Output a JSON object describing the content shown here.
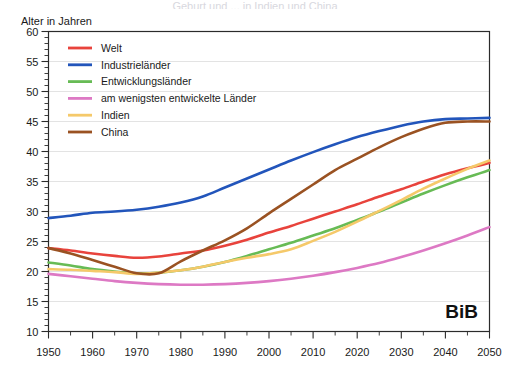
{
  "title": "Geburt und ... in Indien und China",
  "axis": {
    "ylabel": "Alter in Jahren",
    "xlabel": "",
    "y_ticks": [
      "10",
      "15",
      "20",
      "25",
      "30",
      "35",
      "40",
      "45",
      "50",
      "55",
      "60"
    ],
    "x_ticks": [
      "1950",
      "1960",
      "1970",
      "1980",
      "1990",
      "2000",
      "2010",
      "2020",
      "2030",
      "2040",
      "2050"
    ]
  },
  "watermark": "BiB",
  "legend": {
    "position": "top-left-inside",
    "entries": [
      {
        "label": "Welt",
        "color": "#e8433c"
      },
      {
        "label": "Industrieländer",
        "color": "#2255bb"
      },
      {
        "label": "Entwicklungsländer",
        "color": "#67bb55"
      },
      {
        "label": "am wenigsten entwickelte Länder",
        "color": "#dd79c4"
      },
      {
        "label": "Indien",
        "color": "#f5c96a"
      },
      {
        "label": "China",
        "color": "#9a5222"
      }
    ]
  },
  "colors": {
    "welt": "#e8433c",
    "industrielaender": "#2255bb",
    "entwicklungslaender": "#67bb55",
    "ldc": "#dd79c4",
    "indien": "#f5c96a",
    "china": "#9a5222",
    "grid": "#e3e3e3",
    "frame": "#2b2b2b"
  },
  "chart_data": {
    "type": "line",
    "title": "Geburt und ... in Indien und China",
    "xlabel": "",
    "ylabel": "Alter in Jahren",
    "xlim": [
      1950,
      2050
    ],
    "ylim": [
      10,
      60
    ],
    "grid": true,
    "legend_position": "top-left-inside",
    "x": [
      1950,
      1955,
      1960,
      1965,
      1970,
      1975,
      1980,
      1985,
      1990,
      1995,
      2000,
      2005,
      2010,
      2015,
      2020,
      2025,
      2030,
      2035,
      2040,
      2045,
      2050
    ],
    "series": [
      {
        "name": "Welt",
        "color": "#e8433c",
        "values": [
          23.9,
          23.5,
          23.0,
          22.6,
          22.3,
          22.5,
          23.0,
          23.5,
          24.3,
          25.3,
          26.5,
          27.6,
          28.8,
          30.0,
          31.2,
          32.5,
          33.7,
          35.0,
          36.2,
          37.2,
          38.1
        ]
      },
      {
        "name": "Industrieländer",
        "color": "#2255bb",
        "values": [
          28.9,
          29.3,
          29.8,
          30.0,
          30.3,
          30.8,
          31.5,
          32.5,
          34.0,
          35.5,
          37.0,
          38.5,
          39.9,
          41.2,
          42.4,
          43.4,
          44.3,
          45.0,
          45.4,
          45.5,
          45.6
        ]
      },
      {
        "name": "Entwicklungsländer",
        "color": "#67bb55",
        "values": [
          21.5,
          21.0,
          20.4,
          20.0,
          19.7,
          19.8,
          20.2,
          20.8,
          21.6,
          22.6,
          23.7,
          24.8,
          26.0,
          27.2,
          28.6,
          30.0,
          31.5,
          33.0,
          34.4,
          35.7,
          36.9
        ]
      },
      {
        "name": "am wenigsten entwickelte Länder",
        "color": "#dd79c4",
        "values": [
          19.6,
          19.2,
          18.8,
          18.4,
          18.1,
          17.9,
          17.8,
          17.8,
          17.9,
          18.1,
          18.4,
          18.8,
          19.3,
          19.9,
          20.6,
          21.4,
          22.4,
          23.5,
          24.7,
          26.0,
          27.4
        ]
      },
      {
        "name": "Indien",
        "color": "#f5c96a",
        "values": [
          20.4,
          20.3,
          20.1,
          19.9,
          19.6,
          19.8,
          20.2,
          20.8,
          21.6,
          22.3,
          22.9,
          23.7,
          25.1,
          26.6,
          28.3,
          30.1,
          31.9,
          33.8,
          35.5,
          37.1,
          38.5
        ]
      },
      {
        "name": "China",
        "color": "#9a5222",
        "values": [
          23.9,
          23.0,
          21.9,
          20.8,
          19.7,
          19.7,
          21.7,
          23.5,
          25.2,
          27.2,
          29.7,
          32.1,
          34.5,
          36.9,
          38.8,
          40.7,
          42.4,
          43.8,
          44.8,
          45.0,
          45.0
        ]
      }
    ]
  }
}
